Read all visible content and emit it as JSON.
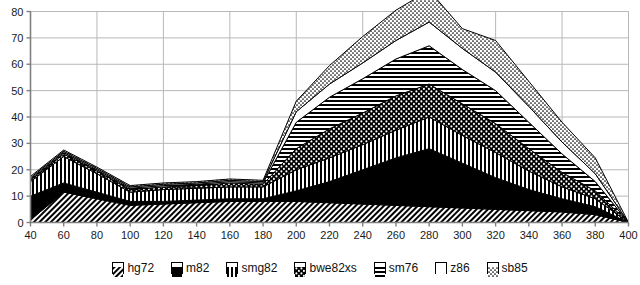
{
  "chart_data": {
    "type": "area",
    "stacked": true,
    "title": "",
    "xlabel": "",
    "ylabel": "",
    "xlim": [
      40,
      400
    ],
    "ylim": [
      0,
      80
    ],
    "ytick_step": 10,
    "xtick_step": 20,
    "grid": true,
    "legend_position": "bottom",
    "x": [
      40,
      60,
      80,
      100,
      120,
      140,
      160,
      180,
      200,
      220,
      240,
      260,
      280,
      300,
      320,
      340,
      360,
      380,
      400
    ],
    "xticklabels": [
      "40",
      "60",
      "80",
      "100",
      "120",
      "140",
      "160",
      "180",
      "200",
      "220",
      "240",
      "260",
      "280",
      "300",
      "320",
      "340",
      "360",
      "380",
      "400"
    ],
    "yticklabels": [
      "0",
      "10",
      "20",
      "30",
      "40",
      "50",
      "60",
      "70",
      "80"
    ],
    "series": [
      {
        "name": "hg72",
        "pattern": "diagonal-hatch",
        "values": [
          1.0,
          11.5,
          9.0,
          6.5,
          7.0,
          7.5,
          8.0,
          8.0,
          8.0,
          7.5,
          7.0,
          6.5,
          6.0,
          5.5,
          5.0,
          4.5,
          4.0,
          3.0,
          0.0
        ]
      },
      {
        "name": "m82",
        "pattern": "solid-black",
        "values": [
          9.0,
          3.5,
          2.5,
          1.5,
          1.0,
          1.0,
          1.0,
          1.0,
          4.0,
          8.0,
          13.0,
          18.0,
          22.0,
          17.0,
          12.0,
          8.0,
          5.0,
          3.0,
          0.0
        ]
      },
      {
        "name": "smg82",
        "pattern": "vertical-stripes",
        "values": [
          5.5,
          10.0,
          7.0,
          3.5,
          4.5,
          4.5,
          4.5,
          4.5,
          8.0,
          9.0,
          9.5,
          10.5,
          12.0,
          10.5,
          9.5,
          7.0,
          4.5,
          3.0,
          0.0
        ]
      },
      {
        "name": "bwe82xs",
        "pattern": "dots-on-black",
        "values": [
          0.5,
          1.0,
          1.0,
          1.0,
          1.0,
          1.0,
          1.5,
          1.0,
          8.0,
          11.0,
          12.0,
          13.0,
          12.5,
          12.0,
          11.0,
          8.5,
          5.5,
          3.0,
          0.0
        ]
      },
      {
        "name": "sm76",
        "pattern": "horizontal-stripes",
        "values": [
          0.5,
          0.5,
          0.5,
          0.5,
          0.5,
          0.5,
          0.5,
          0.5,
          10.0,
          12.0,
          13.0,
          14.0,
          14.5,
          13.0,
          12.5,
          10.0,
          7.0,
          3.5,
          0.0
        ]
      },
      {
        "name": "z86",
        "pattern": "white",
        "values": [
          0.5,
          0.5,
          0.5,
          0.5,
          0.5,
          0.5,
          0.5,
          0.5,
          4.0,
          5.0,
          6.0,
          7.0,
          9.0,
          8.0,
          7.0,
          6.0,
          4.5,
          3.0,
          0.0
        ]
      },
      {
        "name": "sb85",
        "pattern": "fine-dots",
        "values": [
          0.5,
          0.5,
          0.5,
          0.5,
          0.5,
          0.5,
          0.5,
          0.5,
          4.0,
          7.0,
          10.0,
          11.5,
          12.0,
          7.5,
          12.0,
          9.5,
          7.5,
          6.0,
          0.0
        ]
      }
    ]
  },
  "legend": {
    "items": [
      {
        "label": "hg72",
        "pattern": "diagonal-hatch"
      },
      {
        "label": "m82",
        "pattern": "solid-black"
      },
      {
        "label": "smg82",
        "pattern": "vertical-stripes"
      },
      {
        "label": "bwe82xs",
        "pattern": "dots-on-black"
      },
      {
        "label": "sm76",
        "pattern": "horizontal-stripes"
      },
      {
        "label": "z86",
        "pattern": "white"
      },
      {
        "label": "sb85",
        "pattern": "fine-dots"
      }
    ]
  },
  "colors": {
    "ink": "#000000",
    "grid": "#b8b8b8",
    "axis": "#808080",
    "background": "#ffffff"
  }
}
